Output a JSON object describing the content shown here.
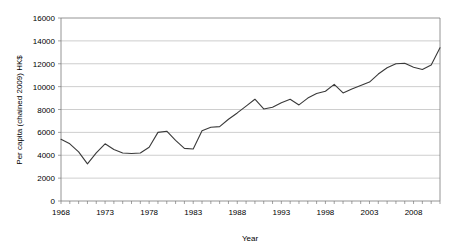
{
  "chart_data": {
    "type": "line",
    "title": "",
    "xlabel": "Year",
    "ylabel": "Per capita (chained 2009) HK$",
    "xlim": [
      1968,
      2011
    ],
    "ylim": [
      0,
      16000
    ],
    "grid": true,
    "legend": false,
    "legend_position": "none",
    "line_color": "#3a3a3a",
    "grid_color": "#b9b9b9",
    "axis_color": "#7a7a7a",
    "y_ticks": [
      0,
      2000,
      4000,
      6000,
      8000,
      10000,
      12000,
      14000,
      16000
    ],
    "y_tick_labels": [
      "0",
      "2000",
      "4000",
      "6000",
      "8000",
      "10000",
      "12000",
      "14000",
      "16000"
    ],
    "x_ticks": [
      1968,
      1973,
      1978,
      1983,
      1988,
      1993,
      1998,
      2003,
      2008
    ],
    "x_tick_labels": [
      "1968",
      "1973",
      "1978",
      "1983",
      "1988",
      "1993",
      "1998",
      "2003",
      "2008"
    ],
    "series": [
      {
        "name": "Per capita (chained 2009) HK$",
        "x": [
          1968,
          1969,
          1970,
          1971,
          1972,
          1973,
          1974,
          1975,
          1976,
          1977,
          1978,
          1979,
          1980,
          1981,
          1982,
          1983,
          1984,
          1985,
          1986,
          1987,
          1988,
          1989,
          1990,
          1991,
          1992,
          1993,
          1994,
          1995,
          1996,
          1997,
          1998,
          1999,
          2000,
          2001,
          2002,
          2003,
          2004,
          2005,
          2006,
          2007,
          2008,
          2009,
          2010,
          2011
        ],
        "values": [
          5400,
          5000,
          4300,
          3250,
          4200,
          5000,
          4500,
          4200,
          4150,
          4200,
          4700,
          6000,
          6100,
          5300,
          4600,
          4550,
          6150,
          6450,
          6500,
          7150,
          7700,
          8300,
          8900,
          8050,
          8200,
          8600,
          8900,
          8400,
          9000,
          9400,
          9600,
          10200,
          9450,
          9800,
          10100,
          10400,
          11100,
          11650,
          12000,
          12050,
          11700,
          11500,
          11900,
          13400
        ]
      }
    ]
  },
  "axis_titles": {
    "x": "Year",
    "y": "Per capita (chained 2009) HK$"
  }
}
